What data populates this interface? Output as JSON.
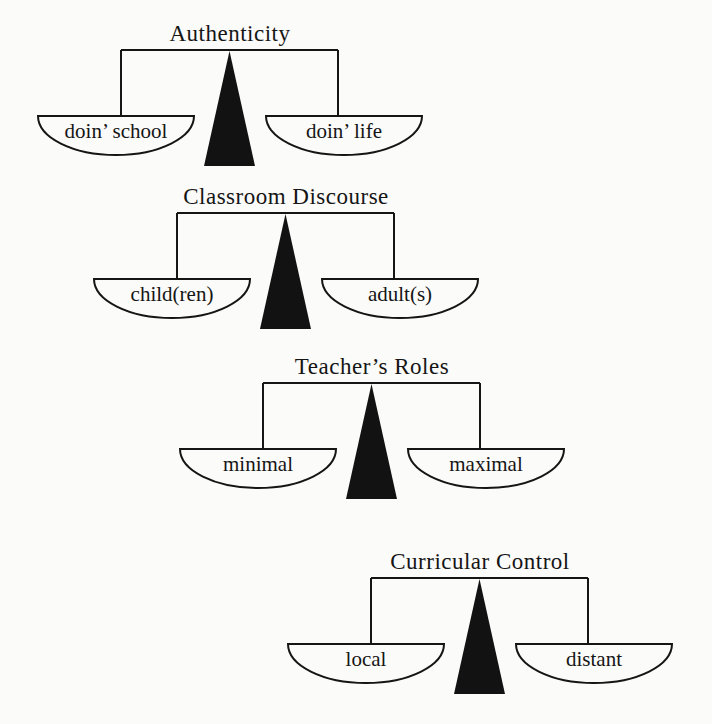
{
  "figure": {
    "background_color": "#fbfbf9",
    "ink_color": "#151515",
    "scales": [
      {
        "title": "Authenticity",
        "left_pan": "doin’ school",
        "right_pan": "doin’ life"
      },
      {
        "title": "Classroom Discourse",
        "left_pan": "child(ren)",
        "right_pan": "adult(s)"
      },
      {
        "title": "Teacher’s Roles",
        "left_pan": "minimal",
        "right_pan": "maximal"
      },
      {
        "title": "Curricular Control",
        "left_pan": "local",
        "right_pan": "distant"
      }
    ]
  }
}
